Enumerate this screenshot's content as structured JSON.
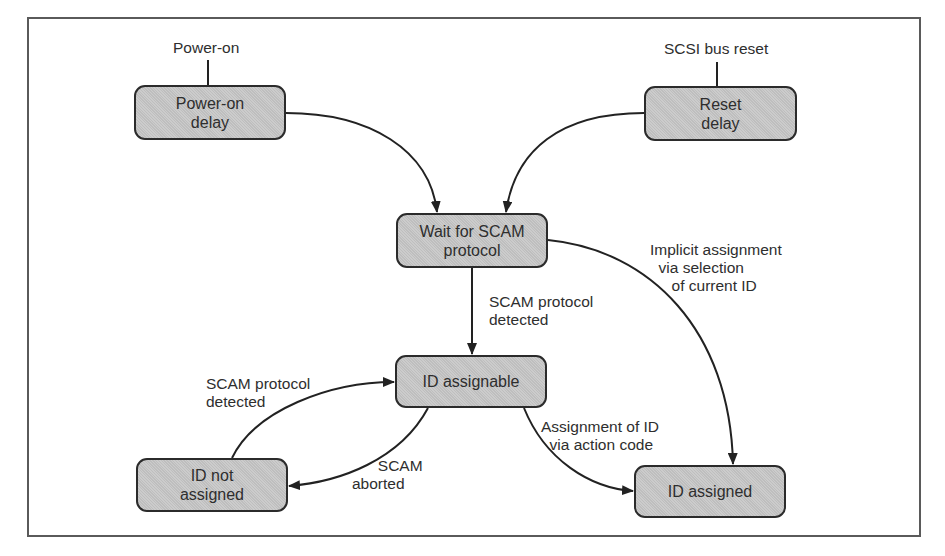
{
  "diagram": {
    "type": "state-diagram",
    "nodes": [
      {
        "id": "power_on_delay",
        "label": "Power-on\ndelay"
      },
      {
        "id": "reset_delay",
        "label": "Reset\ndelay"
      },
      {
        "id": "wait_for_scam",
        "label": "Wait for SCAM\nprotocol"
      },
      {
        "id": "id_assignable",
        "label": "ID assignable"
      },
      {
        "id": "id_not_assigned",
        "label": "ID not\nassigned"
      },
      {
        "id": "id_assigned",
        "label": "ID assigned"
      }
    ],
    "inputs": {
      "power_on": "Power-on",
      "scsi_bus_reset": "SCSI bus reset"
    },
    "edges": [
      {
        "from": "power_on_delay",
        "to": "wait_for_scam",
        "label": ""
      },
      {
        "from": "reset_delay",
        "to": "wait_for_scam",
        "label": ""
      },
      {
        "from": "wait_for_scam",
        "to": "id_assignable",
        "label": "SCAM protocol\ndetected"
      },
      {
        "from": "wait_for_scam",
        "to": "id_assigned",
        "label": "Implicit assignment\n  via selection\n     of current ID"
      },
      {
        "from": "id_not_assigned",
        "to": "id_assignable",
        "label": "SCAM protocol\ndetected"
      },
      {
        "from": "id_assignable",
        "to": "id_not_assigned",
        "label": "      SCAM\naborted"
      },
      {
        "from": "id_assignable",
        "to": "id_assigned",
        "label": "Assignment of ID\n  via action code"
      }
    ]
  },
  "colors": {
    "node_fill": "#c6c6c6",
    "stroke": "#2b2b2b",
    "frame": "#5a5a5a"
  }
}
